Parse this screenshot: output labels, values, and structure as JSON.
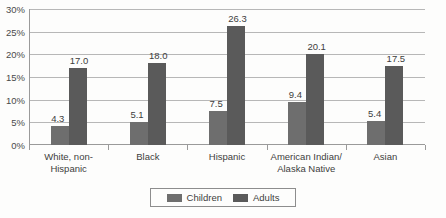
{
  "chart_data": {
    "type": "bar",
    "title": "",
    "xlabel": "",
    "ylabel": "",
    "ylim": [
      0,
      30
    ],
    "ytick_labels": [
      "30%",
      "25%",
      "20%",
      "15%",
      "10%",
      "5%",
      "0%"
    ],
    "ytick_values": [
      30,
      25,
      20,
      15,
      10,
      5,
      0
    ],
    "grid": true,
    "legend_position": "bottom-center",
    "categories": [
      "White, non-Hispanic",
      "Black",
      "Hispanic",
      "American Indian/ Alaska Native",
      "Asian"
    ],
    "category_lines": [
      [
        "White, non-",
        "Hispanic"
      ],
      [
        "Black"
      ],
      [
        "Hispanic"
      ],
      [
        "American Indian/",
        "Alaska Native"
      ],
      [
        "Asian"
      ]
    ],
    "series": [
      {
        "name": "Children",
        "color": "#6e6e6e",
        "values": [
          4.3,
          5.1,
          7.5,
          9.4,
          5.4
        ],
        "labels": [
          "4.3",
          "5.1",
          "7.5",
          "9.4",
          "5.4"
        ]
      },
      {
        "name": "Adults",
        "color": "#5a5a5a",
        "values": [
          17.0,
          18.0,
          26.3,
          20.1,
          17.5
        ],
        "labels": [
          "17.0",
          "18.0",
          "26.3",
          "20.1",
          "17.5"
        ]
      }
    ]
  },
  "legend": {
    "children_label": "Children",
    "adults_label": "Adults"
  },
  "colors": {
    "children": "#6e6e6e",
    "adults": "#5a5a5a",
    "gridline": "#b7b7b7",
    "axis": "#9a9a9a",
    "text": "#3d3d3d",
    "background": "#fdfdfc"
  }
}
